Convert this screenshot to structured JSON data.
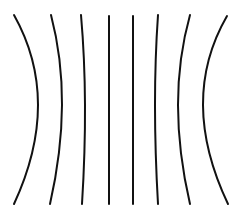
{
  "diagram": {
    "stroke_color": "#111111",
    "background_color": "#ffffff",
    "stroke_width": 2,
    "lines": [
      {
        "id": "line-1",
        "top": [
          14,
          15
        ],
        "mid": [
          38,
          105
        ],
        "bottom": [
          14,
          204
        ]
      },
      {
        "id": "line-2",
        "top": [
          51,
          15
        ],
        "mid": [
          62,
          105
        ],
        "bottom": [
          50,
          204
        ]
      },
      {
        "id": "line-3",
        "top": [
          81,
          15
        ],
        "mid": [
          85,
          105
        ],
        "bottom": [
          82,
          204
        ]
      },
      {
        "id": "line-4",
        "top": [
          109,
          16
        ],
        "mid": [
          109,
          105
        ],
        "bottom": [
          109,
          204
        ]
      },
      {
        "id": "line-5",
        "top": [
          133,
          16
        ],
        "mid": [
          133,
          105
        ],
        "bottom": [
          133,
          204
        ]
      },
      {
        "id": "line-6",
        "top": [
          158,
          15
        ],
        "mid": [
          155,
          105
        ],
        "bottom": [
          158,
          204
        ]
      },
      {
        "id": "line-7",
        "top": [
          190,
          15
        ],
        "mid": [
          178,
          105
        ],
        "bottom": [
          190,
          204
        ]
      },
      {
        "id": "line-8",
        "top": [
          227,
          16
        ],
        "mid": [
          203,
          105
        ],
        "bottom": [
          228,
          204
        ]
      }
    ]
  }
}
